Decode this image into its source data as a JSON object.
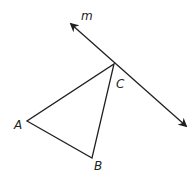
{
  "diagram": {
    "line": {
      "label": "m",
      "label_pos": [
        86,
        19
      ],
      "start": [
        71,
        24
      ],
      "end": [
        186,
        126
      ],
      "arrows": "both",
      "passes_through": "C"
    },
    "triangle": {
      "vertices": {
        "A": [
          27,
          121
        ],
        "B": [
          92,
          158
        ],
        "C": [
          114,
          64
        ]
      },
      "labels": {
        "A": {
          "text": "A",
          "pos": [
            15,
            129
          ]
        },
        "B": {
          "text": "B",
          "pos": [
            94,
            170
          ]
        },
        "C": {
          "text": "C",
          "pos": [
            116,
            88
          ]
        }
      }
    },
    "stroke_color": "#231f20"
  }
}
